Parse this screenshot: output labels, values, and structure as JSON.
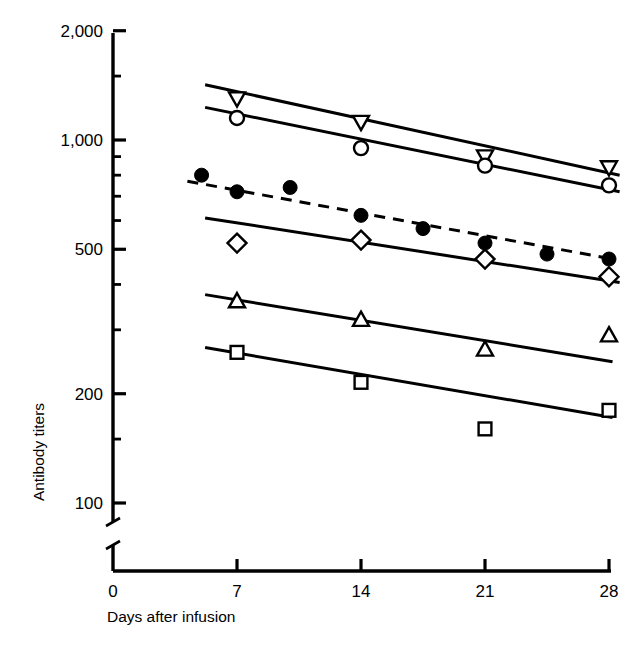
{
  "chart_data": {
    "type": "line",
    "title": "",
    "xlabel": "Days after infusion",
    "ylabel": "Antibody titers",
    "yscale": "log",
    "y_axis_broken": true,
    "grid": false,
    "legend": "none",
    "xlim": [
      0,
      28
    ],
    "ylim": [
      100,
      2000
    ],
    "x_ticks": [
      0,
      7,
      14,
      21,
      28
    ],
    "x_tick_labels": [
      "0",
      "7",
      "14",
      "21",
      "28"
    ],
    "y_ticks_labeled": [
      100,
      200,
      500,
      1000,
      2000
    ],
    "y_tick_labels": [
      "100",
      "200",
      "500",
      "1,000",
      "2,000"
    ],
    "y_ticks_minor": [
      300,
      400,
      600,
      700,
      800,
      900
    ],
    "series": [
      {
        "name": "series-down-triangle",
        "marker": "down-triangle",
        "line_style": "solid",
        "x": [
          7,
          14,
          21,
          28
        ],
        "values": [
          1300,
          1120,
          900,
          840
        ],
        "fit_line": {
          "x": [
            5.2,
            28.6
          ],
          "values": [
            1420,
            800
          ]
        }
      },
      {
        "name": "series-open-circle",
        "marker": "open-circle",
        "line_style": "solid",
        "x": [
          7,
          14,
          21,
          28
        ],
        "values": [
          1150,
          950,
          850,
          750
        ],
        "fit_line": {
          "x": [
            5.2,
            28.6
          ],
          "values": [
            1230,
            720
          ]
        }
      },
      {
        "name": "series-filled-circle",
        "marker": "filled-circle",
        "line_style": "dashed",
        "x": [
          5,
          7,
          10,
          14,
          17.5,
          21,
          24.5,
          28
        ],
        "values": [
          800,
          720,
          740,
          620,
          570,
          520,
          485,
          470
        ],
        "fit_line": {
          "x": [
            4.2,
            28.4
          ],
          "values": [
            770,
            468
          ]
        }
      },
      {
        "name": "series-open-diamond",
        "marker": "open-diamond",
        "line_style": "solid",
        "x": [
          7,
          14,
          21,
          28
        ],
        "values": [
          520,
          530,
          470,
          420
        ],
        "fit_line": {
          "x": [
            5.2,
            28.6
          ],
          "values": [
            610,
            405
          ]
        }
      },
      {
        "name": "series-up-triangle",
        "marker": "up-triangle",
        "line_style": "solid",
        "x": [
          7,
          14,
          21,
          28
        ],
        "values": [
          360,
          320,
          265,
          290
        ],
        "fit_line": {
          "x": [
            5.2,
            28.2
          ],
          "values": [
            375,
            245
          ]
        }
      },
      {
        "name": "series-open-square",
        "marker": "open-square",
        "line_style": "solid",
        "x": [
          7,
          14,
          21,
          28
        ],
        "values": [
          260,
          215,
          160,
          180
        ],
        "fit_line": {
          "x": [
            5.2,
            28.2
          ],
          "values": [
            268,
            172
          ]
        }
      }
    ]
  },
  "axes": {
    "y_label": "Antibody titers",
    "x_label": "Days after infusion"
  }
}
